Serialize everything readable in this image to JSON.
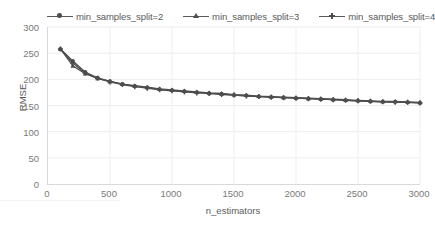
{
  "chart_data": {
    "type": "line",
    "title": "",
    "xlabel": "n_estimators",
    "ylabel": "RMSE",
    "xlim": [
      0,
      3000
    ],
    "ylim": [
      0,
      300
    ],
    "xticks": [
      0,
      500,
      1000,
      1500,
      2000,
      2500,
      3000
    ],
    "yticks": [
      0,
      50,
      100,
      150,
      200,
      250,
      300
    ],
    "grid": "horizontal-and-vertical-light",
    "legend_position": "top",
    "x": [
      100,
      200,
      300,
      400,
      500,
      600,
      700,
      800,
      900,
      1000,
      1100,
      1200,
      1300,
      1400,
      1500,
      1600,
      1700,
      1800,
      1900,
      2000,
      2100,
      2200,
      2300,
      2400,
      2500,
      2600,
      2700,
      2800,
      2900,
      3000
    ],
    "series": [
      {
        "name": "min_samples_split=2",
        "marker": "circle",
        "color": "#4d4d4d",
        "values": [
          258,
          235,
          214,
          203,
          196,
          191,
          187,
          184,
          181,
          179,
          177,
          175,
          173,
          172,
          170,
          169,
          167,
          166,
          165,
          164,
          163,
          162,
          161,
          160,
          159,
          158,
          157,
          157,
          156,
          155
        ]
      },
      {
        "name": "min_samples_split=3",
        "marker": "triangle",
        "color": "#4d4d4d",
        "values": [
          258,
          226,
          211,
          202,
          196,
          191,
          188,
          185,
          182,
          180,
          178,
          176,
          174,
          173,
          171,
          170,
          168,
          167,
          166,
          165,
          164,
          163,
          162,
          161,
          160,
          159,
          158,
          158,
          157,
          156
        ]
      },
      {
        "name": "min_samples_split=4",
        "marker": "plus",
        "color": "#4d4d4d",
        "values": [
          258,
          231,
          212,
          202,
          195,
          190,
          186,
          183,
          180,
          178,
          176,
          174,
          173,
          171,
          170,
          168,
          167,
          166,
          165,
          164,
          163,
          162,
          161,
          160,
          159,
          158,
          157,
          156,
          156,
          155
        ]
      }
    ]
  }
}
